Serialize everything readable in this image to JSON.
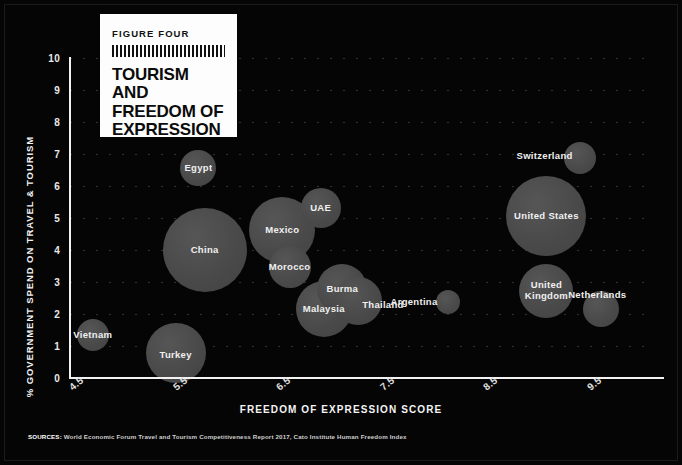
{
  "card": {
    "kicker": "FIGURE FOUR",
    "title_line1": "TOURISM AND",
    "title_line2": "FREEDOM OF",
    "title_line3": "EXPRESSION"
  },
  "sources": {
    "lead": "SOURCES:",
    "text": " World Economic Forum Travel and Tourism Competitiveness Report 2017, Cato Institute Human Freedom Index"
  },
  "chart_data": {
    "type": "scatter",
    "title": "TOURISM AND FREEDOM OF EXPRESSION",
    "xlabel": "FREEDOM OF EXPRESSION SCORE",
    "ylabel": "% GOVERNMENT SPEND ON TRAVEL & TOURISM",
    "xlim": [
      4.5,
      10.1
    ],
    "ylim": [
      0,
      10
    ],
    "xticks": [
      "4.5",
      "5.5",
      "6.5",
      "7.5",
      "8.5",
      "9.5"
    ],
    "xtick_values": [
      4.5,
      5.5,
      6.5,
      7.5,
      8.5,
      9.5
    ],
    "yticks": [
      "0",
      "1",
      "2",
      "3",
      "4",
      "5",
      "6",
      "7",
      "8",
      "9",
      "10"
    ],
    "ytick_values": [
      0,
      1,
      2,
      3,
      4,
      5,
      6,
      7,
      8,
      9,
      10
    ],
    "grid": "horizontal-dotted",
    "legend": "none",
    "bubble_color": "#4b4b4b",
    "background": "#050505",
    "points": [
      {
        "label": "Vietnam",
        "x": 4.72,
        "y": 1.35,
        "r": 16,
        "label_dx": 0,
        "label_dy": 0
      },
      {
        "label": "Turkey",
        "x": 5.52,
        "y": 0.78,
        "r": 30,
        "label_dx": 0,
        "label_dy": 2
      },
      {
        "label": "Egypt",
        "x": 5.74,
        "y": 6.55,
        "r": 18,
        "label_dx": 0,
        "label_dy": 0
      },
      {
        "label": "China",
        "x": 5.8,
        "y": 4.0,
        "r": 42,
        "label_dx": 0,
        "label_dy": 0
      },
      {
        "label": "Mexico",
        "x": 6.55,
        "y": 4.62,
        "r": 33,
        "label_dx": 0,
        "label_dy": 0
      },
      {
        "label": "Morocco",
        "x": 6.62,
        "y": 3.48,
        "r": 21,
        "label_dx": 0,
        "label_dy": 0
      },
      {
        "label": "UAE",
        "x": 6.92,
        "y": 5.3,
        "r": 20,
        "label_dx": 0,
        "label_dy": 0
      },
      {
        "label": "Malaysia",
        "x": 6.95,
        "y": 2.15,
        "r": 28,
        "label_dx": 0,
        "label_dy": 0
      },
      {
        "label": "Burma",
        "x": 7.13,
        "y": 2.78,
        "r": 25,
        "label_dx": 0,
        "label_dy": 0
      },
      {
        "label": "Thailand",
        "x": 7.28,
        "y": 2.42,
        "r": 24,
        "label_dx": 25,
        "label_dy": 4
      },
      {
        "label": "Argentina",
        "x": 8.15,
        "y": 2.38,
        "r": 12,
        "label_dx": -34,
        "label_dy": 0
      },
      {
        "label": "United States",
        "x": 9.1,
        "y": 5.05,
        "r": 40,
        "label_dx": 0,
        "label_dy": 0
      },
      {
        "label": "United Kingdom",
        "x": 9.1,
        "y": 2.72,
        "r": 27,
        "label_dx": 0,
        "label_dy": 0
      },
      {
        "label": "Switzerland",
        "x": 9.42,
        "y": 6.88,
        "r": 16,
        "label_dx": -35,
        "label_dy": -2
      },
      {
        "label": "Netherlands",
        "x": 9.63,
        "y": 2.15,
        "r": 18,
        "label_dx": -4,
        "label_dy": -14
      }
    ]
  }
}
